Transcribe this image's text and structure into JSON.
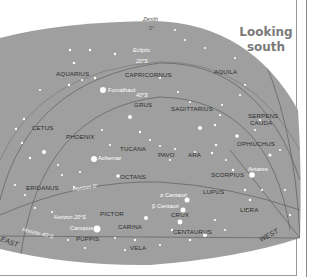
{
  "title": {
    "line1": "Looking",
    "line2": "south"
  },
  "colors": {
    "sky": "#9f9f9f",
    "line": "#5f5f5f",
    "star": "#ffffff",
    "text": "#2e2e2e",
    "title": "#7a7a7a",
    "frame": "#9a9a9a"
  },
  "zenith": {
    "label": "Zenith",
    "value": "0°"
  },
  "ecliptic": {
    "label": "Ecliptic"
  },
  "altitude_lines": [
    {
      "label": "20°S"
    },
    {
      "label": "40°S"
    }
  ],
  "horizons": [
    {
      "label": "Horizon 0°"
    },
    {
      "label": "Horizon 20°S"
    },
    {
      "label": "Horizon 40°S"
    }
  ],
  "directions": {
    "east": "EAST",
    "west": "WEST"
  },
  "constellations": [
    {
      "name": "AQUARIUS"
    },
    {
      "name": "CAPRICORNUS"
    },
    {
      "name": "AQUILA"
    },
    {
      "name": "GRUS"
    },
    {
      "name": "SAGITTARIUS"
    },
    {
      "name": "SERPENS"
    },
    {
      "name": "CAUDA"
    },
    {
      "name": "CETUS"
    },
    {
      "name": "PHOENIX"
    },
    {
      "name": "TUCANA"
    },
    {
      "name": "PAVO"
    },
    {
      "name": "ARA"
    },
    {
      "name": "OPHIUCHUS"
    },
    {
      "name": "OCTANS"
    },
    {
      "name": "SCORPIUS"
    },
    {
      "name": "ERIDANUS"
    },
    {
      "name": "LUPUS"
    },
    {
      "name": "LIBRA"
    },
    {
      "name": "PICTOR"
    },
    {
      "name": "CRUX"
    },
    {
      "name": "CARINA"
    },
    {
      "name": "CENTAURUS"
    },
    {
      "name": "PUPPIS"
    },
    {
      "name": "VELA"
    }
  ],
  "stars": [
    {
      "name": "Fomalhaut"
    },
    {
      "name": "Achernar"
    },
    {
      "name": "Antares"
    },
    {
      "name": "α Centauri"
    },
    {
      "name": "β Centauri"
    },
    {
      "name": "Canopus"
    }
  ]
}
